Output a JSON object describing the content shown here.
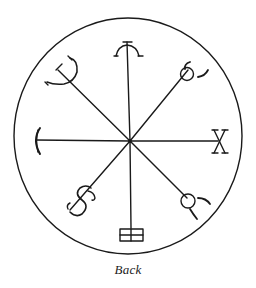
{
  "figure": {
    "caption": "Back",
    "stroke_color": "#1a1a1a",
    "background_color": "#ffffff",
    "circle": {
      "cx": 128,
      "cy": 136,
      "r": 115
    },
    "center": {
      "x": 130,
      "y": 141
    },
    "spokes": [
      {
        "direction": "north",
        "symbol": "arc-with-hooks"
      },
      {
        "direction": "north-east",
        "symbol": "circle-with-horns"
      },
      {
        "direction": "east",
        "symbol": "x-cross"
      },
      {
        "direction": "south-east",
        "symbol": "circle-with-horns"
      },
      {
        "direction": "south",
        "symbol": "double-box"
      },
      {
        "direction": "south-west",
        "symbol": "s-curve-hook"
      },
      {
        "direction": "west",
        "symbol": "crescent-bar"
      },
      {
        "direction": "north-west",
        "symbol": "trident-hook"
      }
    ]
  }
}
